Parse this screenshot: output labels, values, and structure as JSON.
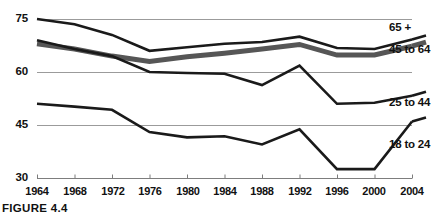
{
  "figure": {
    "caption": "FIGURE 4.4"
  },
  "chart_data": {
    "type": "line",
    "title": "",
    "xlabel": "",
    "ylabel": "",
    "grid": true,
    "legend_position": "right-inline",
    "x": [
      1964,
      1968,
      1972,
      1976,
      1980,
      1984,
      1988,
      1992,
      1996,
      2000,
      2004
    ],
    "xticklabels": [
      "1964",
      "1968",
      "1972",
      "1976",
      "1980",
      "1984",
      "1988",
      "1992",
      "1996",
      "2000",
      "2004"
    ],
    "yticklabels": [
      "75",
      "60",
      "45",
      "30"
    ],
    "yticks": [
      75,
      60,
      45,
      30
    ],
    "ylim": [
      30,
      78
    ],
    "xlim": [
      1964,
      2004
    ],
    "series": [
      {
        "name": "65 +",
        "color": "#1a1a1a",
        "width": 2.6,
        "values": [
          75.0,
          73.5,
          70.5,
          66.0,
          67.0,
          68.0,
          68.5,
          70.0,
          66.8,
          66.5,
          69.2
        ]
      },
      {
        "name": "45 to 64",
        "color": "#565656",
        "width": 5.0,
        "values": [
          68.0,
          66.5,
          64.5,
          63.0,
          64.3,
          65.3,
          66.5,
          67.8,
          64.8,
          64.8,
          67.3
        ]
      },
      {
        "name": "25 to 44",
        "color": "#1a1a1a",
        "width": 2.6,
        "values": [
          69.0,
          66.5,
          64.5,
          60.0,
          59.7,
          59.5,
          56.3,
          61.8,
          51.0,
          51.3,
          53.3
        ]
      },
      {
        "name": "18 to 24",
        "color": "#1a1a1a",
        "width": 2.6,
        "values": [
          51.0,
          50.2,
          49.3,
          43.0,
          41.5,
          41.8,
          39.5,
          43.8,
          32.5,
          32.5,
          46.0
        ]
      }
    ]
  },
  "axes": {
    "geometry": {
      "plot_left": 37,
      "plot_right": 412,
      "y_top_px": 19,
      "y_top_val": 75,
      "y_bot_px": 178,
      "y_bot_val": 30
    },
    "colors": {
      "gridline": "#9b9b9b",
      "axis": "#7d7d7d",
      "text": "#111111"
    }
  }
}
